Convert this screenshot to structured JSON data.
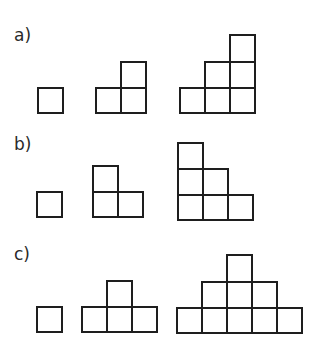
{
  "stroke_color": "#1e1e1e",
  "label_color": "#2a2a2a",
  "rows": [
    {
      "label": "a)",
      "label_pos": {
        "x": 14,
        "y": 27
      },
      "figures": [
        {
          "name": "a-figure-1",
          "cells": [
            [
              37,
              87,
              27,
              27
            ]
          ]
        },
        {
          "name": "a-figure-2",
          "cells": [
            [
              95,
              87,
              27,
              27
            ],
            [
              120,
              87,
              27,
              27
            ],
            [
              120,
              61,
              27,
              28
            ]
          ]
        },
        {
          "name": "a-figure-3",
          "cells": [
            [
              179,
              87,
              27,
              27
            ],
            [
              204,
              87,
              27,
              27
            ],
            [
              229,
              87,
              27,
              27
            ],
            [
              204,
              61,
              27,
              28
            ],
            [
              229,
              61,
              27,
              28
            ],
            [
              229,
              34,
              27,
              29
            ]
          ]
        }
      ]
    },
    {
      "label": "b)",
      "label_pos": {
        "x": 14,
        "y": 136
      },
      "figures": [
        {
          "name": "b-figure-1",
          "cells": [
            [
              36,
              191,
              27,
              27
            ]
          ]
        },
        {
          "name": "b-figure-2",
          "cells": [
            [
              92,
              191,
              27,
              27
            ],
            [
              117,
              191,
              27,
              27
            ],
            [
              92,
              165,
              27,
              28
            ]
          ]
        },
        {
          "name": "b-figure-3",
          "cells": [
            [
              177,
              194,
              27,
              27
            ],
            [
              202,
              194,
              27,
              27
            ],
            [
              227,
              194,
              27,
              27
            ],
            [
              177,
              168,
              27,
              28
            ],
            [
              202,
              168,
              27,
              28
            ],
            [
              177,
              142,
              27,
              28
            ]
          ]
        }
      ]
    },
    {
      "label": "c)",
      "label_pos": {
        "x": 14,
        "y": 246
      },
      "figures": [
        {
          "name": "c-figure-1",
          "cells": [
            [
              36,
              306,
              27,
              27
            ]
          ]
        },
        {
          "name": "c-figure-2",
          "cells": [
            [
              81,
              306,
              27,
              27
            ],
            [
              106,
              306,
              27,
              27
            ],
            [
              131,
              306,
              27,
              27
            ],
            [
              106,
              280,
              27,
              28
            ]
          ]
        },
        {
          "name": "c-figure-3",
          "cells": [
            [
              176,
              307,
              27,
              27
            ],
            [
              201,
              307,
              27,
              27
            ],
            [
              226,
              307,
              27,
              27
            ],
            [
              251,
              307,
              27,
              27
            ],
            [
              276,
              307,
              27,
              27
            ],
            [
              201,
              281,
              27,
              28
            ],
            [
              226,
              281,
              27,
              28
            ],
            [
              251,
              281,
              27,
              28
            ],
            [
              226,
              254,
              27,
              29
            ]
          ]
        }
      ]
    }
  ]
}
